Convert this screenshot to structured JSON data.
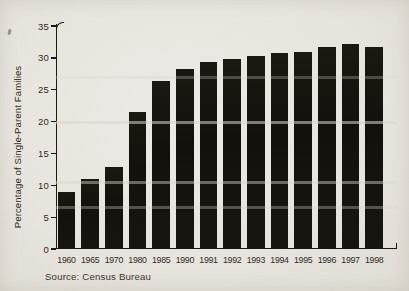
{
  "figure": {
    "background_color": "#e8e5df",
    "bar_color": "#17140f",
    "text_color": "#2e2b25",
    "source": "Source: Census Bureau"
  },
  "chart_data": {
    "type": "bar",
    "title": "",
    "categories": [
      "1960",
      "1965",
      "1970",
      "1980",
      "1985",
      "1990",
      "1991",
      "1992",
      "1993",
      "1994",
      "1995",
      "1996",
      "1997",
      "1998"
    ],
    "values": [
      9.0,
      11.0,
      12.8,
      21.5,
      26.3,
      28.2,
      29.3,
      29.8,
      30.3,
      30.8,
      31.0,
      31.7,
      32.2,
      31.7
    ],
    "xlabel": "",
    "ylabel": "Percentage of Single-Parent Families",
    "ylim": [
      0,
      35
    ],
    "yticks": [
      0,
      5,
      10,
      15,
      20,
      25,
      30,
      35
    ],
    "grid": false,
    "legend": null,
    "source": "Source: Census Bureau"
  }
}
